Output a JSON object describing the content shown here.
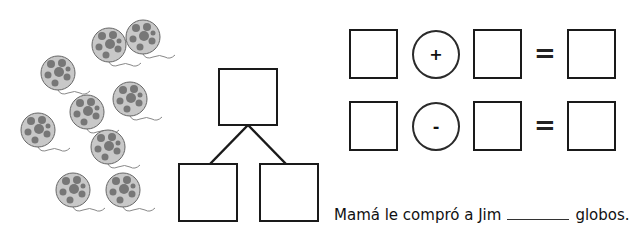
{
  "balloons": {
    "count": 9,
    "color_body": "#c8c8c8",
    "color_spots": "#777777",
    "items": [
      {
        "cx": 143,
        "cy": 37
      },
      {
        "cx": 109,
        "cy": 45
      },
      {
        "cx": 58,
        "cy": 73
      },
      {
        "cx": 130,
        "cy": 99
      },
      {
        "cx": 87,
        "cy": 112
      },
      {
        "cx": 38,
        "cy": 130
      },
      {
        "cx": 108,
        "cy": 147
      },
      {
        "cx": 73,
        "cy": 190
      },
      {
        "cx": 123,
        "cy": 190
      }
    ]
  },
  "number_bond": {
    "top": "",
    "left": "",
    "right": ""
  },
  "equations": [
    {
      "a": "",
      "operator": "+",
      "b": "",
      "equals": "=",
      "result": ""
    },
    {
      "a": "",
      "operator": "-",
      "b": "",
      "equals": "=",
      "result": ""
    }
  ],
  "sentence": {
    "before": "Mamá le compró a Jim",
    "after": "globos."
  }
}
